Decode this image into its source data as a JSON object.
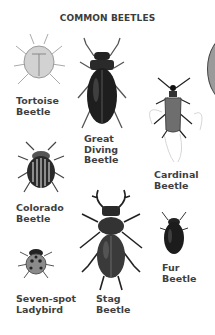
{
  "page": {
    "title": "COMMON BEETLES",
    "beetles": [
      {
        "name": "Tortoise Beetle",
        "label": "Tortoise\nBeetle",
        "icon": "tortoise-beetle-illustration"
      },
      {
        "name": "Great Diving Beetle",
        "label": "Great\nDiving\nBeetle",
        "icon": "great-diving-beetle-illustration"
      },
      {
        "name": "Cardinal Beetle",
        "label": "Cardinal\nBeetle",
        "icon": "cardinal-beetle-illustration"
      },
      {
        "name": "Colorado Beetle",
        "label": "Colorado\nBeetle",
        "icon": "colorado-beetle-illustration"
      },
      {
        "name": "Seven-spot Ladybird",
        "label": "Seven-spot\nLadybird",
        "icon": "ladybird-illustration"
      },
      {
        "name": "Stag Beetle",
        "label": "Stag\nBeetle",
        "icon": "stag-beetle-illustration"
      },
      {
        "name": "Fur Beetle",
        "label": "Fur\nBeetle",
        "icon": "fur-beetle-illustration"
      }
    ]
  }
}
